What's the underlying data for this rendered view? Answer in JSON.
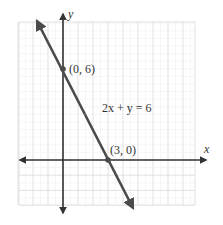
{
  "chart_data": {
    "type": "line",
    "title": "",
    "xlabel": "x",
    "ylabel": "y",
    "equation": "2x + y = 6",
    "series": [
      {
        "name": "2x + y = 6",
        "x": [
          -1.7,
          4.7
        ],
        "y": [
          9.4,
          -3.4
        ]
      }
    ],
    "points": [
      {
        "label": "(0, 6)",
        "x": 0,
        "y": 6
      },
      {
        "label": "(3, 0)",
        "x": 3,
        "y": 0
      }
    ],
    "xlim": [
      -3,
      9
    ],
    "ylim": [
      -3,
      9
    ],
    "grid": true,
    "legend": "none"
  },
  "labels": {
    "x_axis": "x",
    "y_axis": "y",
    "equation": "2x + y = 6",
    "point_a": "(0, 6)",
    "point_b": "(3, 0)"
  },
  "colors": {
    "line": "#4a4a4a",
    "axis": "#333333",
    "grid": "#d9d9d9",
    "grid_fine": "#ececec"
  }
}
